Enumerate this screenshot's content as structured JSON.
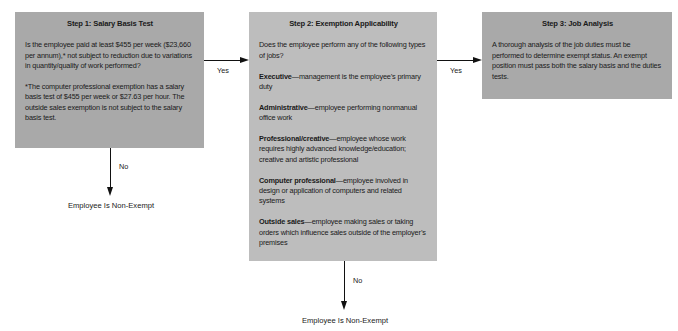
{
  "step1": {
    "title": "Step 1: Salary Basis Test",
    "question": "Is the employee paid at least $455 per week ($23,660 per annum),* not subject to reduction due to variations in quantity/quality of work performed?",
    "footnote": "*The computer professional exemption has a salary basis test of $455 per week or $27.63 per hour. The outside sales exemption is not subject to the salary basis test."
  },
  "step2": {
    "title": "Step 2: Exemption Applicability",
    "question": "Does the employee perform any of the following types of jobs?",
    "exemptions": [
      {
        "name": "Executive",
        "description": "—management is the employee’s primary duty"
      },
      {
        "name": "Administrative",
        "description": "—employee performing nonmanual office work"
      },
      {
        "name": "Professional/creative",
        "description": "—employee whose work requires highly advanced knowledge/education; creative and artistic professional"
      },
      {
        "name": "Computer professional",
        "description": "—employee involved in design or application of computers and related systems"
      },
      {
        "name": "Outside sales",
        "description": "—employee making sales or taking orders which influence sales outside of the employer’s premises"
      }
    ]
  },
  "step3": {
    "title": "Step 3: Job Analysis",
    "text": "A thorough analysis of the job duties must be performed to determine exempt status. An exempt position must pass both the salary basis and the duties tests."
  },
  "edges": {
    "step1_to_step2": "Yes",
    "step2_to_step3": "Yes",
    "step1_no": "No",
    "step2_no": "No"
  },
  "outcomes": {
    "step1_no_result": "Employee Is Non-Exempt",
    "step2_no_result": "Employee Is Non-Exempt"
  },
  "colors": {
    "box_dark": "#a9a9a9",
    "box_light": "#bdbdbd",
    "line": "#111111"
  }
}
